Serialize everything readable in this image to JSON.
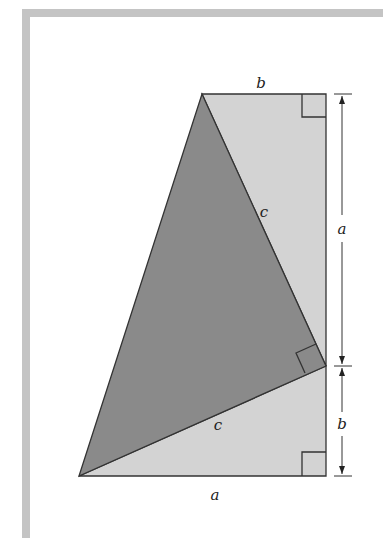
{
  "figure": {
    "labels": {
      "top_edge": "b",
      "right_upper": "a",
      "right_lower": "b",
      "bottom_edge": "a",
      "hyp_upper": "c",
      "hyp_lower": "c"
    },
    "colors": {
      "frame": "#c4c4c4",
      "light_fill": "#d3d3d3",
      "dark_fill": "#8a8a8a",
      "stroke": "#333333"
    }
  }
}
